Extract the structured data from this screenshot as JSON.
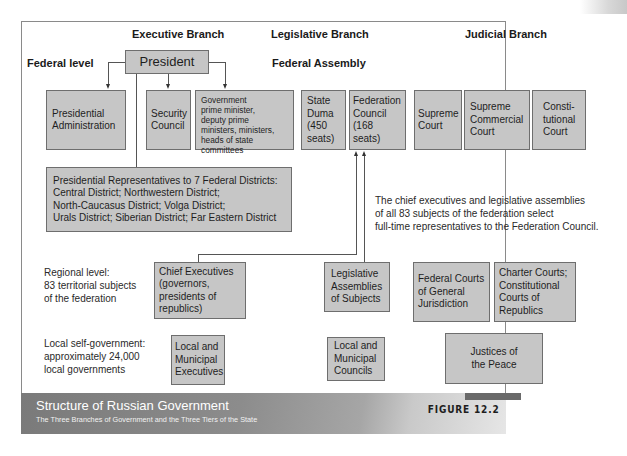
{
  "headers": {
    "executive": "Executive Branch",
    "legislative": "Legislative Branch",
    "judicial": "Judicial Branch",
    "federal_level": "Federal level",
    "federal_assembly": "Federal Assembly"
  },
  "federal": {
    "president": "President",
    "presidential_administration": [
      "Presidential",
      "Administration"
    ],
    "security_council": [
      "Security",
      "Council"
    ],
    "government": [
      "Government",
      "prime minister,",
      "deputy prime",
      "ministers, ministers,",
      "heads of state",
      "committees"
    ],
    "state_duma": [
      "State",
      "Duma",
      "(450",
      "seats)"
    ],
    "federation_council": [
      "Federation",
      "Council",
      "(168",
      "seats)"
    ],
    "supreme_court": [
      "Supreme",
      "Court"
    ],
    "supreme_commercial_court": [
      "Supreme",
      "Commercial",
      "Court"
    ],
    "constitutional_court": [
      "Consti-",
      "tutional",
      "Court"
    ],
    "presidential_representatives": [
      "Presidential Representatives to 7 Federal Districts:",
      "Central District; Northwestern District;",
      "North-Caucasus District; Volga District;",
      "Urals District; Siberian District; Far Eastern District"
    ],
    "federation_council_note": [
      "The chief executives and legislative assemblies",
      "of all 83 subjects of the federation select",
      "full-time representatives to the Federation Council."
    ]
  },
  "regional": {
    "label": [
      "Regional level:",
      "83 territorial subjects",
      "of the federation"
    ],
    "chief_executives": [
      "Chief Executives",
      "(governors,",
      "presidents of",
      "republics)"
    ],
    "legislative_assemblies": [
      "Legislative",
      "Assemblies",
      "of Subjects"
    ],
    "federal_courts": [
      "Federal Courts",
      "of General",
      "Jurisdiction"
    ],
    "charter_courts": [
      "Charter Courts;",
      "Constitutional",
      "Courts of",
      "Republics"
    ]
  },
  "local": {
    "label": [
      "Local self-government:",
      "approximately 24,000",
      "local governments"
    ],
    "executives": [
      "Local and",
      "Municipal",
      "Executives"
    ],
    "councils": [
      "Local and",
      "Municipal",
      "Councils"
    ],
    "justices": [
      "Justices of",
      "the Peace"
    ]
  },
  "caption": {
    "title": "Structure of Russian Government",
    "subtitle": "The Three Branches of Government and the Three Tiers of the State",
    "figure": "FIGURE 12.2"
  },
  "colors": {
    "box_fill": "#c6c6c6",
    "box_border": "#6e6e6e",
    "caption_bg": "#7a7a7a"
  }
}
